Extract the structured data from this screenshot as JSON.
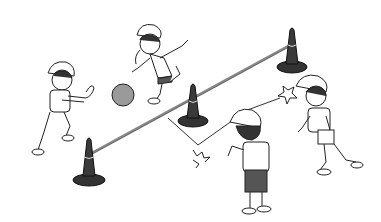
{
  "scene": {
    "description": "Line illustration of four children playing a ball game over a rope strung between three traffic cones",
    "colors": {
      "background": "#ffffff",
      "ink": "#222222",
      "cone": "#3a3a3a",
      "shorts": "#555555",
      "ball": "#9a9a9a",
      "rope": "#888888"
    },
    "elements": {
      "cones": [
        "cone-left",
        "cone-middle",
        "cone-right"
      ],
      "children": [
        "child-left-catching",
        "child-top-throwing",
        "child-front-back-view",
        "child-right-running"
      ],
      "ball": "ball",
      "motion_marks": [
        "impact-star-1",
        "impact-star-2"
      ]
    }
  }
}
